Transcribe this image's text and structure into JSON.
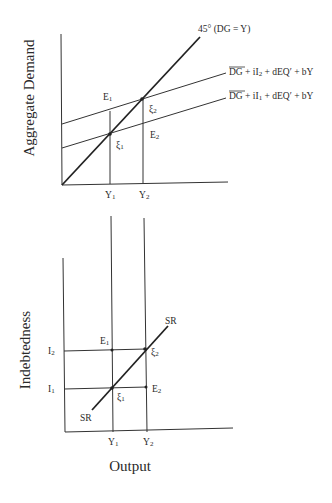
{
  "top_chart": {
    "y_axis_title": "Aggregate Demand",
    "x_ticks": [
      {
        "label": "Y",
        "sub": "1"
      },
      {
        "label": "Y",
        "sub": "2"
      }
    ],
    "lines": {
      "diagonal_label": "45°  (DG = Y)",
      "upper": {
        "bar": "DG",
        "rest_a": " + iI",
        "sub": "2",
        "rest_b": " + dEQ′ + bY"
      },
      "lower": {
        "bar": "DG",
        "rest_a": " + iI",
        "sub": "1",
        "rest_b": " + dEQ′ + bY"
      }
    },
    "points": {
      "E1": {
        "label": "E",
        "sub": "1"
      },
      "E2": {
        "label": "E",
        "sub": "2"
      },
      "xi1": {
        "label": "ξ",
        "sub": "1"
      },
      "xi2": {
        "label": "ξ",
        "sub": "2"
      }
    }
  },
  "bottom_chart": {
    "y_axis_title": "Indebtedness",
    "x_axis_title": "Output",
    "y_ticks": [
      {
        "label": "I",
        "sub": "2"
      },
      {
        "label": "I",
        "sub": "1"
      }
    ],
    "x_ticks": [
      {
        "label": "Y",
        "sub": "1"
      },
      {
        "label": "Y",
        "sub": "2"
      }
    ],
    "curve_label_top": "SR",
    "curve_label_bottom": "SR",
    "points": {
      "E1": {
        "label": "E",
        "sub": "1"
      },
      "E2": {
        "label": "E",
        "sub": "2"
      },
      "xi1": {
        "label": "ξ",
        "sub": "1"
      },
      "xi2": {
        "label": "ξ",
        "sub": "2"
      }
    }
  }
}
